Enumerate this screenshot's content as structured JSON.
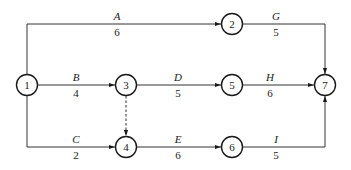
{
  "diagram": {
    "type": "activity-on-arrow network",
    "nodes": [
      {
        "id": "1",
        "label": "1",
        "x": 27,
        "y": 85
      },
      {
        "id": "2",
        "label": "2",
        "x": 232,
        "y": 24
      },
      {
        "id": "3",
        "label": "3",
        "x": 126,
        "y": 85
      },
      {
        "id": "4",
        "label": "4",
        "x": 126,
        "y": 147
      },
      {
        "id": "5",
        "label": "5",
        "x": 232,
        "y": 85
      },
      {
        "id": "6",
        "label": "6",
        "x": 232,
        "y": 147
      },
      {
        "id": "7",
        "label": "7",
        "x": 325,
        "y": 85
      }
    ],
    "activities": [
      {
        "name": "A",
        "duration": "6",
        "from": "1",
        "to": "2"
      },
      {
        "name": "B",
        "duration": "4",
        "from": "1",
        "to": "3"
      },
      {
        "name": "C",
        "duration": "2",
        "from": "1",
        "to": "4"
      },
      {
        "name": "D",
        "duration": "5",
        "from": "3",
        "to": "5"
      },
      {
        "name": "E",
        "duration": "6",
        "from": "4",
        "to": "6"
      },
      {
        "name": "G",
        "duration": "5",
        "from": "2",
        "to": "7"
      },
      {
        "name": "H",
        "duration": "6",
        "from": "5",
        "to": "7"
      },
      {
        "name": "I",
        "duration": "5",
        "from": "6",
        "to": "7"
      }
    ],
    "dummy_activities": [
      {
        "from": "3",
        "to": "4",
        "style": "dashed"
      }
    ]
  }
}
